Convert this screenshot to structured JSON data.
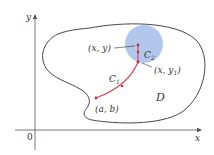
{
  "colors": {
    "axis": "#555555",
    "boundary": "#333333",
    "curve": "#d93b4a",
    "point": "#b5303c",
    "disk": "#a9c1ea",
    "text": "#333333"
  },
  "axes": {
    "x_label": "x",
    "y_label": "y",
    "origin_label": "0"
  },
  "region": {
    "label": "D"
  },
  "disk": {
    "label_main": "C",
    "label_sub": "2"
  },
  "curve": {
    "label_main": "C",
    "label_sub": "1"
  },
  "points": {
    "start": "(a, b)",
    "top": "(x, y)",
    "lower_main": "(x, y",
    "lower_sub": "1",
    "lower_close": ")"
  }
}
